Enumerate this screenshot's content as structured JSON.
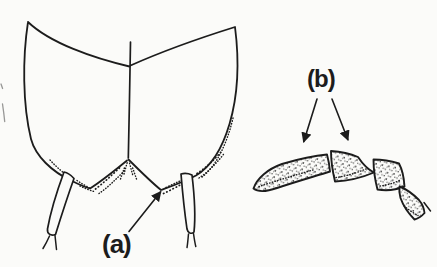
{
  "canvas": {
    "width": 437,
    "height": 267,
    "background_color": "#fbfbf9",
    "ink_color": "#1c1c1c"
  },
  "labels": {
    "a": {
      "text": "(a)"
    },
    "b": {
      "text": "(b)"
    }
  },
  "drawing": {
    "left_part": "paired-wing-cases-with-two-forked-appendages",
    "right_part": "stippled-four-segment-club-appendage",
    "label_a_points_to": "notch-at-base-of-right-wing-case",
    "label_b_points_to": "first-and-second-club-segments"
  }
}
